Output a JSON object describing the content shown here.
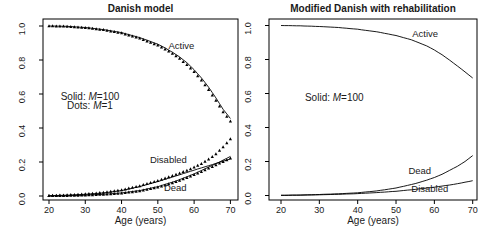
{
  "figure": {
    "background": "#ffffff",
    "line_color": "#000000",
    "text_color": "#1a1a1a"
  },
  "chart_data": [
    {
      "type": "line",
      "title": "Danish model",
      "xlabel": "Age (years)",
      "ylabel": "",
      "xlim": [
        20,
        70
      ],
      "ylim": [
        0.0,
        1.0
      ],
      "x_ticks": [
        20,
        30,
        40,
        50,
        60,
        70
      ],
      "y_ticks": [
        0.0,
        0.2,
        0.4,
        0.6,
        0.8,
        1.0
      ],
      "grid": false,
      "legend_annotations": [
        {
          "parts": [
            "Solid: ",
            "M",
            "=100"
          ],
          "x": 31.3,
          "y": 0.585
        },
        {
          "parts": [
            "Dots: ",
            "M",
            "=1"
          ],
          "x": 31.3,
          "y": 0.527
        }
      ],
      "curve_labels": [
        {
          "text": "Active",
          "x": 56.5,
          "y": 0.885
        },
        {
          "text": "Disabled",
          "x": 52.9,
          "y": 0.21
        },
        {
          "text": "Dead",
          "x": 54.8,
          "y": 0.045
        }
      ],
      "series": [
        {
          "name": "Active (M=100)",
          "style": "solid",
          "points": [
            [
              20,
              1.0
            ],
            [
              25,
              0.998
            ],
            [
              30,
              0.991
            ],
            [
              35,
              0.979
            ],
            [
              40,
              0.961
            ],
            [
              45,
              0.932
            ],
            [
              50,
              0.893
            ],
            [
              52,
              0.871
            ],
            [
              54,
              0.846
            ],
            [
              56,
              0.818
            ],
            [
              58,
              0.784
            ],
            [
              60,
              0.743
            ],
            [
              62,
              0.695
            ],
            [
              64,
              0.64
            ],
            [
              66,
              0.577
            ],
            [
              68,
              0.51
            ],
            [
              70,
              0.456
            ]
          ]
        },
        {
          "name": "Active (M=1)",
          "style": "dots",
          "points": [
            [
              20,
              1.0
            ],
            [
              25,
              0.997
            ],
            [
              30,
              0.99
            ],
            [
              35,
              0.977
            ],
            [
              40,
              0.958
            ],
            [
              45,
              0.927
            ],
            [
              50,
              0.886
            ],
            [
              52,
              0.863
            ],
            [
              54,
              0.838
            ],
            [
              56,
              0.808
            ],
            [
              58,
              0.772
            ],
            [
              60,
              0.73
            ],
            [
              62,
              0.681
            ],
            [
              64,
              0.625
            ],
            [
              66,
              0.561
            ],
            [
              68,
              0.494
            ],
            [
              70,
              0.44
            ]
          ]
        },
        {
          "name": "Disabled (M=100)",
          "style": "solid",
          "points": [
            [
              20,
              0.002
            ],
            [
              25,
              0.005
            ],
            [
              30,
              0.01
            ],
            [
              35,
              0.018
            ],
            [
              40,
              0.032
            ],
            [
              45,
              0.055
            ],
            [
              50,
              0.085
            ],
            [
              55,
              0.118
            ],
            [
              60,
              0.152
            ],
            [
              65,
              0.185
            ],
            [
              70,
              0.218
            ]
          ]
        },
        {
          "name": "Disabled (M=1)",
          "style": "dots",
          "points": [
            [
              20,
              0.002
            ],
            [
              25,
              0.005
            ],
            [
              30,
              0.011
            ],
            [
              35,
              0.02
            ],
            [
              40,
              0.035
            ],
            [
              45,
              0.059
            ],
            [
              50,
              0.09
            ],
            [
              55,
              0.126
            ],
            [
              58,
              0.15
            ],
            [
              60,
              0.168
            ],
            [
              62,
              0.19
            ],
            [
              64,
              0.215
            ],
            [
              66,
              0.247
            ],
            [
              68,
              0.288
            ],
            [
              70,
              0.335
            ]
          ]
        },
        {
          "name": "Dead (M=100)",
          "style": "solid",
          "points": [
            [
              20,
              0.001
            ],
            [
              25,
              0.002
            ],
            [
              30,
              0.005
            ],
            [
              35,
              0.01
            ],
            [
              40,
              0.018
            ],
            [
              45,
              0.032
            ],
            [
              50,
              0.055
            ],
            [
              55,
              0.088
            ],
            [
              60,
              0.13
            ],
            [
              65,
              0.18
            ],
            [
              67,
              0.2
            ],
            [
              70,
              0.233
            ]
          ]
        },
        {
          "name": "Dead (M=1)",
          "style": "dots",
          "points": [
            [
              20,
              0.001
            ],
            [
              25,
              0.002
            ],
            [
              30,
              0.004
            ],
            [
              35,
              0.009
            ],
            [
              40,
              0.016
            ],
            [
              45,
              0.029
            ],
            [
              50,
              0.051
            ],
            [
              55,
              0.083
            ],
            [
              60,
              0.124
            ],
            [
              65,
              0.172
            ],
            [
              70,
              0.222
            ]
          ]
        }
      ]
    },
    {
      "type": "line",
      "title": "Modified Danish with rehabilitation",
      "xlabel": "Age (years)",
      "ylabel": "",
      "xlim": [
        20,
        70
      ],
      "ylim": [
        0.0,
        1.0
      ],
      "x_ticks": [
        20,
        30,
        40,
        50,
        60,
        70
      ],
      "y_ticks": [
        0.0,
        0.2,
        0.4,
        0.6,
        0.8,
        1.0
      ],
      "grid": false,
      "legend_annotations": [
        {
          "parts": [
            "Solid: ",
            "M",
            "=100"
          ],
          "x": 33.9,
          "y": 0.571
        }
      ],
      "curve_labels": [
        {
          "text": "Active",
          "x": 57.6,
          "y": 0.948
        },
        {
          "text": "Dead",
          "x": 56.2,
          "y": 0.145
        },
        {
          "text": "Disabled",
          "x": 58.8,
          "y": 0.036
        }
      ],
      "series": [
        {
          "name": "Active (M=100)",
          "style": "solid",
          "points": [
            [
              20,
              1.0
            ],
            [
              25,
              0.998
            ],
            [
              30,
              0.994
            ],
            [
              35,
              0.988
            ],
            [
              40,
              0.978
            ],
            [
              45,
              0.963
            ],
            [
              50,
              0.941
            ],
            [
              54,
              0.916
            ],
            [
              58,
              0.88
            ],
            [
              60,
              0.856
            ],
            [
              62,
              0.828
            ],
            [
              64,
              0.796
            ],
            [
              66,
              0.762
            ],
            [
              68,
              0.727
            ],
            [
              70,
              0.691
            ]
          ]
        },
        {
          "name": "Dead (M=100)",
          "style": "solid",
          "points": [
            [
              20,
              0.001
            ],
            [
              25,
              0.003
            ],
            [
              30,
              0.006
            ],
            [
              35,
              0.01
            ],
            [
              40,
              0.016
            ],
            [
              45,
              0.027
            ],
            [
              50,
              0.044
            ],
            [
              55,
              0.07
            ],
            [
              58,
              0.09
            ],
            [
              60,
              0.106
            ],
            [
              62,
              0.125
            ],
            [
              64,
              0.148
            ],
            [
              66,
              0.172
            ],
            [
              68,
              0.2
            ],
            [
              70,
              0.235
            ]
          ]
        },
        {
          "name": "Disabled (M=100)",
          "style": "solid",
          "points": [
            [
              20,
              0.001
            ],
            [
              25,
              0.002
            ],
            [
              30,
              0.004
            ],
            [
              35,
              0.007
            ],
            [
              40,
              0.011
            ],
            [
              45,
              0.017
            ],
            [
              50,
              0.025
            ],
            [
              55,
              0.036
            ],
            [
              60,
              0.049
            ],
            [
              65,
              0.065
            ],
            [
              70,
              0.087
            ]
          ]
        }
      ]
    }
  ]
}
